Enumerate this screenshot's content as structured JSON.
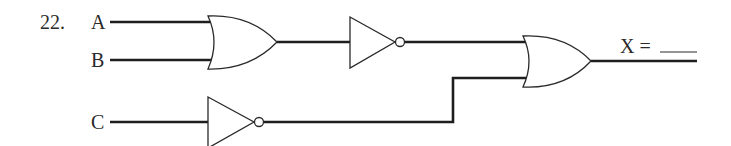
{
  "problem": {
    "number": "22.",
    "inputs": [
      {
        "id": "A",
        "label": "A"
      },
      {
        "id": "B",
        "label": "B"
      },
      {
        "id": "C",
        "label": "C"
      }
    ],
    "output": {
      "id": "X",
      "label": "X =",
      "answer_blank": ""
    },
    "gates": [
      {
        "id": "g1",
        "type": "OR",
        "inputs": [
          "A",
          "B"
        ]
      },
      {
        "id": "g2",
        "type": "NOT",
        "inputs": [
          "g1"
        ]
      },
      {
        "id": "g3",
        "type": "NOT",
        "inputs": [
          "C"
        ]
      },
      {
        "id": "g4",
        "type": "OR",
        "inputs": [
          "g2",
          "g3"
        ],
        "output": "X"
      }
    ]
  }
}
